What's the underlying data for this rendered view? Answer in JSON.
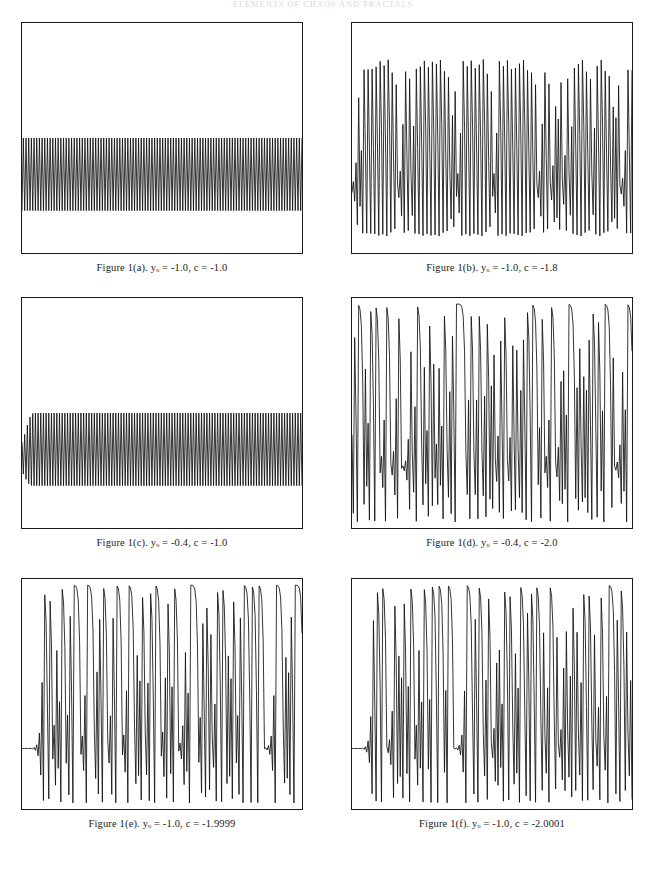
{
  "page": {
    "running_head": "ELEMENTS OF CHAOS AND FRACTALS",
    "figure_label": "Figure 1"
  },
  "panels": [
    {
      "id": "a",
      "caption_prefix": "Figure 1(a).",
      "var_symbol": "y",
      "var_subscript": "o",
      "y0_text": " = -1.0,",
      "c_text": "c = -1.8",
      "caption_full": "Figure 1(a).  yₒ = -1.0, c = -1.0",
      "y0": -1.0,
      "c": -1.0,
      "regime": "stable period-2 oscillation, constant small amplitude"
    },
    {
      "id": "b",
      "caption_prefix": "Figure 1(b).",
      "var_symbol": "y",
      "var_subscript": "o",
      "caption_full": "Figure 1(b).  yₒ = -1.0, c = -1.8",
      "y0": -1.0,
      "c": -1.8,
      "regime": "chaotic large-amplitude bursts with intermittent low window"
    },
    {
      "id": "c",
      "caption_prefix": "Figure 1(c).",
      "var_symbol": "y",
      "var_subscript": "o",
      "caption_full": "Figure 1(c).  yₒ = -0.4, c = -1.0",
      "y0": -0.4,
      "c": -1.0,
      "regime": "growing transient settling into regular period-2 oscillation"
    },
    {
      "id": "d",
      "caption_prefix": "Figure 1(d).",
      "var_symbol": "y",
      "var_subscript": "o",
      "caption_full": "Figure 1(d).  yₒ = -0.4, c = -2.0",
      "y0": -0.4,
      "c": -2.0,
      "regime": "fully developed chaos, full-range excursions"
    },
    {
      "id": "e",
      "caption_prefix": "Figure 1(e).",
      "var_symbol": "y",
      "var_subscript": "o",
      "caption_full": "Figure 1(e).  yₒ = -1.0, c = -1.9999",
      "y0": -1.0,
      "c": -1.9999,
      "regime": "long flat transient then chaotic bursts with flat-topped peaks"
    },
    {
      "id": "f",
      "caption_prefix": "Figure 1(f).",
      "var_symbol": "y",
      "var_subscript": "o",
      "caption_full": "Figure 1(f).  yₒ = -1.0, c = -2.0001",
      "y0": -1.0,
      "c": -2.0001,
      "regime": "long flat transient then chaotic bursts, escapes after burst train"
    }
  ],
  "captions": {
    "a": "Figure 1(a).  yₒ = -1.0, c = -1.0",
    "b": "Figure 1(b).  yₒ = -1.0, c = -1.8",
    "c": "Figure 1(c).  yₒ = -0.4, c = -1.0",
    "d": "Figure 1(d).  yₒ = -0.4, c = -2.0",
    "e": "Figure 1(e).  yₒ = -1.0, c = -1.9999",
    "f": "Figure 1(f).  yₒ = -1.0, c = -2.0001"
  },
  "chart_data": {
    "type": "line",
    "xlabel": "",
    "ylabel": "",
    "grid": false,
    "legend": "none",
    "axis_ticks_shown": false,
    "panel_count": 6,
    "charts": [
      {
        "id": "a",
        "title": "Figure 1(a).  yₒ = -1.0, c = -1.0",
        "params": {
          "y0": -1.0,
          "c": -1.0
        },
        "xlim": [
          0,
          100
        ],
        "ylim": [
          -1.5,
          1.5
        ],
        "description": "Period-2 square oscillation of constant amplitude spanning the full run; about 40 visible cycles.",
        "series": [
          {
            "name": "y(n)",
            "values": [
              -1.0,
              0.0,
              -1.0,
              0.0,
              -1.0,
              0.0,
              -1.0,
              0.0,
              -1.0,
              0.0,
              -1.0,
              0.0,
              -1.0,
              0.0,
              -1.0,
              0.0,
              -1.0,
              0.0,
              -1.0,
              0.0,
              -1.0,
              0.0,
              -1.0,
              0.0,
              -1.0,
              0.0,
              -1.0,
              0.0,
              -1.0,
              0.0,
              -1.0,
              0.0,
              -1.0,
              0.0,
              -1.0,
              0.0,
              -1.0,
              0.0,
              -1.0,
              0.0,
              -1.0,
              0.0,
              -1.0,
              0.0,
              -1.0,
              0.0,
              -1.0,
              0.0,
              -1.0,
              0.0,
              -1.0,
              0.0,
              -1.0,
              0.0,
              -1.0,
              0.0,
              -1.0,
              0.0,
              -1.0,
              0.0,
              -1.0,
              0.0,
              -1.0,
              0.0,
              -1.0,
              0.0,
              -1.0,
              0.0,
              -1.0,
              0.0,
              -1.0,
              0.0,
              -1.0,
              0.0,
              -1.0,
              0.0,
              -1.0,
              0.0,
              -1.0,
              0.0
            ]
          }
        ]
      },
      {
        "id": "b",
        "title": "Figure 1(b).  yₒ = -1.0, c = -1.8",
        "params": {
          "y0": -1.0,
          "c": -1.8
        },
        "xlim": [
          0,
          100
        ],
        "ylim": [
          -2.0,
          2.0
        ],
        "description": "Chaotic alternation between sharp high peaks and deep troughs; a short low-amplitude laminar window appears near two thirds of the record.",
        "series": [
          {
            "name": "y(n)",
            "values": [
              -1.0,
              -0.8,
              -1.16,
              -0.45,
              -1.6,
              0.76,
              -1.22,
              -0.31,
              -1.7,
              1.09,
              -0.61,
              -1.43,
              0.24,
              -1.74,
              1.23,
              -0.29,
              -1.71,
              1.14,
              -0.5,
              -1.55,
              0.6,
              -1.44,
              0.27,
              -1.73,
              1.19,
              -0.38,
              -1.66,
              0.96,
              -0.88,
              -1.03,
              -0.74,
              -1.25,
              -0.24,
              -1.74,
              1.22,
              -0.31,
              -1.7,
              1.09,
              -0.61,
              -1.43,
              0.25,
              -1.74,
              1.22,
              -0.31,
              -1.71,
              1.12,
              -0.55,
              -1.5,
              0.44,
              -1.61,
              0.79,
              -1.18,
              -0.42,
              -1.63,
              0.85,
              -1.08,
              -0.63,
              -1.4,
              0.16,
              -1.77,
              1.34,
              0.0,
              -1.8,
              1.44,
              0.28,
              -1.72,
              1.15,
              -0.48,
              -1.57,
              0.66,
              -1.36,
              0.05,
              -1.8,
              1.43,
              0.25,
              -1.74,
              1.23,
              -0.29,
              -1.72,
              1.15
            ]
          }
        ]
      },
      {
        "id": "c",
        "title": "Figure 1(c).  yₒ = -0.4, c = -1.0",
        "params": {
          "y0": -0.4,
          "c": -1.0
        },
        "xlim": [
          0,
          100
        ],
        "ylim": [
          -1.5,
          1.5
        ],
        "description": "Small-amplitude start that grows over the first few cycles and then locks into a steady period-2 oscillation for the remainder.",
        "series": [
          {
            "name": "y(n)",
            "values": [
              -0.4,
              -0.84,
              -0.29,
              -0.91,
              -0.17,
              -0.97,
              -0.06,
              -1.0,
              0.0,
              -1.0,
              0.0,
              -1.0,
              0.0,
              -1.0,
              0.0,
              -1.0,
              0.0,
              -1.0,
              0.0,
              -1.0,
              0.0,
              -1.0,
              0.0,
              -1.0,
              0.0,
              -1.0,
              0.0,
              -1.0,
              0.0,
              -1.0,
              0.0,
              -1.0,
              0.0,
              -1.0,
              0.0,
              -1.0,
              0.0,
              -1.0,
              0.0,
              -1.0,
              0.0,
              -1.0,
              0.0,
              -1.0,
              0.0,
              -1.0,
              0.0,
              -1.0,
              0.0,
              -1.0,
              0.0,
              -1.0,
              0.0,
              -1.0,
              0.0,
              -1.0,
              0.0,
              -1.0,
              0.0,
              -1.0,
              0.0,
              -1.0,
              0.0,
              -1.0,
              0.0,
              -1.0,
              0.0,
              -1.0,
              0.0,
              -1.0,
              0.0,
              -1.0,
              0.0,
              -1.0,
              0.0,
              -1.0,
              0.0,
              -1.0,
              0.0,
              -1.0
            ]
          }
        ]
      },
      {
        "id": "d",
        "title": "Figure 1(d).  yₒ = -0.4, c = -2.0",
        "params": {
          "y0": -0.4,
          "c": -2.0
        },
        "xlim": [
          0,
          100
        ],
        "ylim": [
          -2.0,
          2.0
        ],
        "description": "Fully developed chaos filling the interval [-2, 2]; broad rounded maxima alternate with narrow spikes and deep minima.",
        "series": [
          {
            "name": "y(n)",
            "values": [
              -0.4,
              -1.84,
              1.39,
              -0.07,
              -2.0,
              1.99,
              1.97,
              1.88,
              1.53,
              0.33,
              -1.89,
              1.57,
              0.47,
              -1.78,
              1.17,
              -0.63,
              -1.61,
              0.58,
              -1.67,
              0.78,
              -1.39,
              -0.07,
              -2.0,
              1.99,
              1.96,
              1.85,
              1.43,
              0.05,
              -2.0,
              1.99,
              1.97,
              1.88,
              1.54,
              0.38,
              -1.86,
              1.45,
              0.1,
              -1.99,
              1.96,
              1.85,
              1.42,
              0.02,
              -2.0,
              1.99,
              1.97,
              1.89,
              1.57,
              0.46,
              -1.79,
              1.2,
              -0.56,
              -1.69,
              0.85,
              -1.28,
              -0.37,
              -1.86,
              1.47,
              0.16,
              -1.97,
              1.89,
              1.58,
              0.49,
              -1.76,
              1.1,
              -0.79,
              -1.38,
              -0.1,
              -1.99,
              1.96,
              1.84,
              1.38,
              -0.09,
              -1.99,
              1.97,
              1.88,
              1.54,
              0.37,
              -1.86,
              1.46,
              0.13
            ]
          }
        ]
      },
      {
        "id": "e",
        "title": "Figure 1(e).  yₒ = -1.0, c = -1.9999",
        "params": {
          "y0": -1.0,
          "c": -1.9999
        },
        "xlim": [
          0,
          100
        ],
        "ylim": [
          -2.0,
          2.0
        ],
        "description": "Long quiet laminar transient near the low level for roughly the first fifth of the record, then a sudden escape into chaotic bursts with broad flat-topped maxima.",
        "series": [
          {
            "name": "y(n)",
            "values": [
              -1.0,
              -1.0,
              -1.0,
              -1.0,
              -1.0,
              -1.0,
              -1.0,
              -1.0,
              -1.0,
              -1.0,
              -1.0,
              -1.0,
              -1.0,
              -1.0,
              -0.99,
              -1.02,
              -0.96,
              -1.07,
              -0.85,
              -1.28,
              -0.36,
              -1.87,
              1.5,
              0.25,
              -1.94,
              1.77,
              1.14,
              -0.7,
              -1.51,
              0.28,
              -1.92,
              1.69,
              0.86,
              -1.26,
              -0.41,
              -1.83,
              1.35,
              -0.18,
              -1.97,
              1.88,
              1.54,
              0.37,
              -1.86,
              1.46,
              0.13,
              -1.98,
              1.93,
              1.73,
              0.99,
              -1.02,
              -0.96,
              -1.08,
              -0.83,
              -1.31,
              -0.28,
              -1.92,
              1.69,
              0.86,
              -1.26,
              -0.41,
              -1.83,
              1.36,
              -0.15,
              -1.98,
              1.92,
              1.69,
              0.86,
              -1.26,
              -0.41,
              -1.83,
              1.36,
              -0.15,
              -1.98,
              1.92,
              1.7,
              0.89,
              -1.21,
              -0.54,
              -1.71,
              0.93
            ]
          }
        ]
      },
      {
        "id": "f",
        "title": "Figure 1(f).  yₒ = -1.0, c = -2.0001",
        "params": {
          "y0": -1.0,
          "c": -2.0001
        },
        "xlim": [
          0,
          100
        ],
        "ylim": [
          -2.0,
          2.0
        ],
        "description": "Nearly identical quiet transient to panel (e), then chaotic bursts that diverge from (e) because of the tiny change in c; amplitude envelope decays slightly toward the right.",
        "series": [
          {
            "name": "y(n)",
            "values": [
              -1.0,
              -1.0,
              -1.0,
              -1.0,
              -1.0,
              -1.0,
              -1.0,
              -1.0,
              -1.0,
              -1.0,
              -1.0,
              -1.0,
              -1.0,
              -1.0,
              -0.99,
              -1.02,
              -0.96,
              -1.08,
              -0.84,
              -1.3,
              -0.31,
              -1.9,
              1.62,
              0.63,
              -1.6,
              0.56,
              -1.69,
              0.85,
              -1.28,
              -0.36,
              -1.87,
              1.5,
              0.25,
              -1.94,
              1.77,
              1.14,
              -0.7,
              -1.51,
              0.28,
              -1.92,
              1.69,
              0.86,
              -1.26,
              -0.41,
              -1.83,
              1.35,
              -0.18,
              -1.97,
              1.88,
              1.54,
              0.37,
              -1.86,
              1.46,
              0.13,
              -1.98,
              1.93,
              1.73,
              0.99,
              -1.02,
              -0.96,
              -1.08,
              -0.83,
              -1.31,
              -0.28,
              -1.92,
              1.69,
              0.86,
              -1.26,
              -0.41,
              -1.83,
              1.36,
              -0.15,
              -1.98,
              1.92,
              1.69,
              0.85,
              -1.27,
              -0.38,
              -1.85,
              1.42
            ]
          }
        ]
      }
    ]
  }
}
